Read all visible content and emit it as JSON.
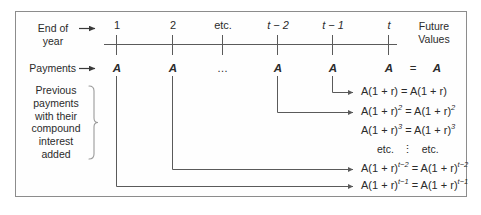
{
  "diagram": {
    "colors": {
      "line": "#5a5a5a",
      "text": "#2b2b2b",
      "border": "#8c8c8c",
      "background": "#ffffff"
    },
    "row_labels": {
      "end_of_year_line1": "End of",
      "end_of_year_line2": "year",
      "payments": "Payments",
      "arrow_glyph": "→"
    },
    "bracket_label_lines": [
      "Previous",
      "payments",
      "with their",
      "compound",
      "interest",
      "added"
    ],
    "future_values_line1": "Future",
    "future_values_line2": "Values",
    "equals_sign": "=",
    "timeline": {
      "tick_labels": [
        "1",
        "2",
        "etc.",
        "t − 2",
        "t − 1",
        "t"
      ],
      "tick_italic": [
        false,
        false,
        false,
        true,
        true,
        true
      ],
      "payment_labels": [
        "A",
        "A",
        "…",
        "A",
        "A",
        "A"
      ],
      "future_value_column_label": "A"
    },
    "formulas": [
      {
        "id": "row-1",
        "left": "A(1 + r)",
        "left_exp": "",
        "right": "A(1 + r)",
        "right_exp": "",
        "equals": "=",
        "source_tick": "t − 1"
      },
      {
        "id": "row-2",
        "left": "A(1 + r)",
        "left_exp": "2",
        "right": "A(1 + r)",
        "right_exp": "2",
        "equals": "=",
        "source_tick": "t − 2"
      },
      {
        "id": "row-3",
        "left": "A(1 + r)",
        "left_exp": "3",
        "right": "A(1 + r)",
        "right_exp": "3",
        "equals": "=",
        "source_tick": ""
      },
      {
        "id": "row-etc",
        "left": "etc.",
        "left_exp": "",
        "right": "etc.",
        "right_exp": "",
        "equals": "⋮",
        "source_tick": ""
      },
      {
        "id": "row-tminus2",
        "left": "A(1 + r)",
        "left_exp": "t−2",
        "right": "A(1 + r)",
        "right_exp": "t−2",
        "equals": "=",
        "source_tick": "2"
      },
      {
        "id": "row-tminus1",
        "left": "A(1 + r)",
        "left_exp": "t−1",
        "right": "A(1 + r)",
        "right_exp": "t−1",
        "equals": "=",
        "source_tick": "1"
      }
    ]
  }
}
